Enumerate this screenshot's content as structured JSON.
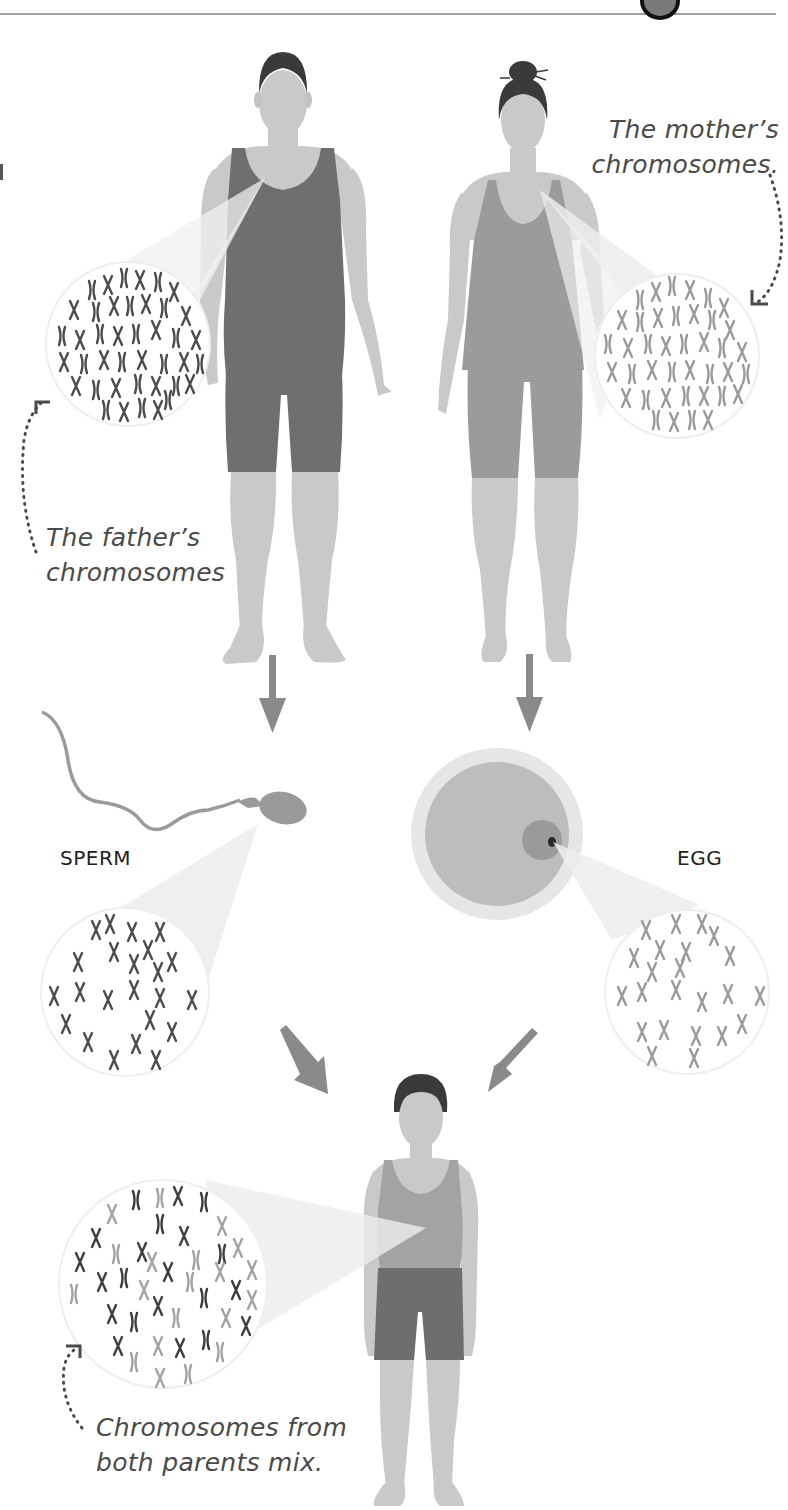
{
  "colors": {
    "skin": "#c9c9c9",
    "hair": "#3a3a3a",
    "father_clothing": "#6f6f6f",
    "mother_clothing": "#9b9b9b",
    "child_top": "#a3a3a3",
    "child_shorts": "#6e6e6e",
    "arrow": "#8a8a8a",
    "father_chromosome": "#4c4c4c",
    "mother_chromosome": "#9a9a9a",
    "magnifier_beam": "#e8e8e8",
    "header_rule": "#9a9a9a",
    "text": "#4a4a4a"
  },
  "figures": {
    "father": {
      "label": "father"
    },
    "mother": {
      "label": "mother"
    },
    "child": {
      "label": "child"
    }
  },
  "captions": {
    "father": {
      "line1": "The father’s",
      "line2": "chromosomes"
    },
    "mother": {
      "line1": "The mother’s",
      "line2": "chromosomes."
    },
    "mix": {
      "line1": "Chromosomes from",
      "line2": "both parents mix."
    }
  },
  "labels": {
    "sperm": "SPERM",
    "egg": "EGG"
  },
  "flow": [
    {
      "from": "father",
      "to": "sperm"
    },
    {
      "from": "mother",
      "to": "egg"
    },
    {
      "from": "sperm",
      "to": "child"
    },
    {
      "from": "egg",
      "to": "child"
    }
  ]
}
